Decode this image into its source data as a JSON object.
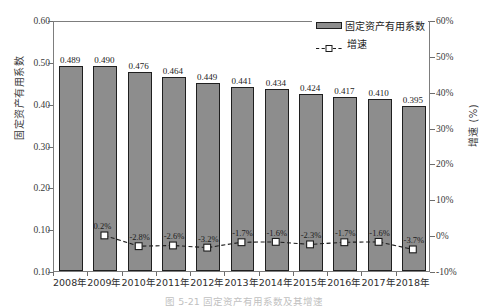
{
  "chart_data": {
    "type": "bar",
    "title": "",
    "caption": "图 5-21  固定资产有用系数及其增速",
    "categories": [
      "2008年",
      "2009年",
      "2010年",
      "2011年",
      "2012年",
      "2013年",
      "2014年",
      "2015年",
      "2016年",
      "2017年",
      "2018年"
    ],
    "series": [
      {
        "name": "固定资产有用系数",
        "type": "bar",
        "axis": "left",
        "values": [
          0.489,
          0.49,
          0.476,
          0.464,
          0.449,
          0.441,
          0.434,
          0.424,
          0.417,
          0.41,
          0.395
        ],
        "labels": [
          "0.489",
          "0.490",
          "0.476",
          "0.464",
          "0.449",
          "0.441",
          "0.434",
          "0.424",
          "0.417",
          "0.410",
          "0.395"
        ],
        "color": "#8d8d8d",
        "border_color": "#1f1f1f"
      },
      {
        "name": "增速",
        "type": "line",
        "axis": "right",
        "values": [
          null,
          0.2,
          -2.8,
          -2.6,
          -3.2,
          -1.7,
          -1.6,
          -2.3,
          -1.7,
          -1.6,
          -3.7
        ],
        "labels": [
          "",
          "0.2%",
          "-2.8%",
          "-2.6%",
          "-3.2%",
          "-1.7%",
          "-1.6%",
          "-2.3%",
          "-1.7%",
          "-1.6%",
          "-3.7%"
        ],
        "color": "#1c1c1c",
        "line_style": "dashed",
        "marker": "open-square"
      }
    ],
    "xlabel": "",
    "ylabel_left": "固定资产有用系数",
    "ylabel_right": "增速 (%)",
    "yticks_left": [
      "0.60",
      "0.50",
      "0.40",
      "0.30",
      "0.20",
      "0.10",
      "0.10"
    ],
    "ytick_values_left": [
      0.6,
      0.5,
      0.4,
      0.3,
      0.2,
      0.1,
      0.0
    ],
    "ylim_left": [
      0.0,
      0.6
    ],
    "yticks_right": [
      "60%",
      "50%",
      "40%",
      "30%",
      "20%",
      "10%",
      "0%",
      "-10%"
    ],
    "ytick_values_right": [
      60,
      50,
      40,
      30,
      20,
      10,
      0,
      -10
    ],
    "ylim_right": [
      -10,
      60
    ],
    "grid": false,
    "legend_position": "top-right",
    "legend_entries": [
      "固定资产有用系数",
      "增速"
    ]
  }
}
